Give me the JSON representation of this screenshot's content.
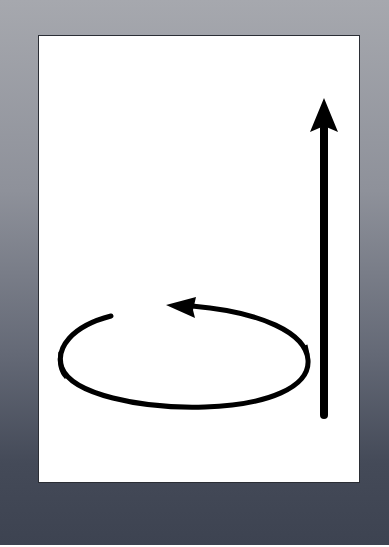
{
  "figure": {
    "colors": {
      "frame_top": "#a6a8ae",
      "frame_bottom": "#3d4351",
      "panel": "#ffffff",
      "ink": "#000000"
    },
    "elements": [
      {
        "name": "straight-arrow",
        "direction": "up"
      },
      {
        "name": "circular-arrow",
        "direction": "counter-clockwise"
      }
    ]
  }
}
